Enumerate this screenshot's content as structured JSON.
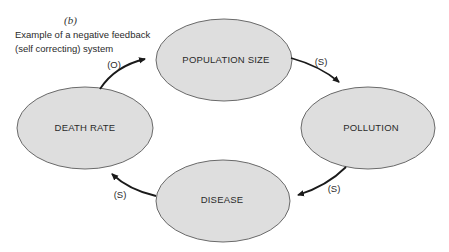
{
  "figure": {
    "panel_label": "(b)",
    "caption_line1": "Example of a negative feedback",
    "caption_line2": "(self correcting) system"
  },
  "nodes": [
    {
      "id": "population",
      "label": "POPULATION SIZE"
    },
    {
      "id": "pollution",
      "label": "POLLUTION"
    },
    {
      "id": "disease",
      "label": "DISEASE"
    },
    {
      "id": "death_rate",
      "label": "DEATH RATE"
    }
  ],
  "edges": [
    {
      "from": "population",
      "to": "pollution",
      "label": "(S)"
    },
    {
      "from": "pollution",
      "to": "disease",
      "label": "(S)"
    },
    {
      "from": "disease",
      "to": "death_rate",
      "label": "(S)"
    },
    {
      "from": "death_rate",
      "to": "population",
      "label": "(O)"
    }
  ],
  "colors": {
    "node_fill": "#dedede",
    "node_stroke": "#6a6a6a",
    "arrow": "#1a1a1a",
    "text": "#2a2a2a"
  }
}
